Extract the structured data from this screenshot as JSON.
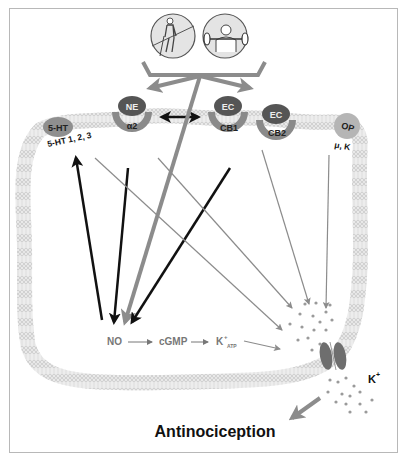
{
  "figure": {
    "exercise_icons": [
      {
        "name": "aerobic-exercise",
        "description": "person walking/running on incline"
      },
      {
        "name": "resistance-exercise",
        "description": "person lifting barbell"
      }
    ],
    "receptors": [
      {
        "ligand": "5-HT",
        "receptor": "5-HT 1, 2, 3"
      },
      {
        "ligand": "NE",
        "receptor": "α2"
      },
      {
        "ligand": "EC",
        "receptor": "CB1"
      },
      {
        "ligand": "EC",
        "receptor": "CB2"
      },
      {
        "ligand": "OP",
        "receptor": "μ, K"
      }
    ],
    "pathway": {
      "no": "NO",
      "cgmp": "cGMP",
      "katp_base": "K",
      "katp_sup": "+",
      "katp_sub": "ATP"
    },
    "channel_ion": {
      "base": "K",
      "sup": "+"
    },
    "outcome": "Antinociception",
    "colors": {
      "membrane": "#c8c8c8",
      "ligand_dark": "#5a5a5a",
      "ligand_light": "#9a9a9a",
      "receptor": "#8a8a8a",
      "arrow_black": "#111111",
      "arrow_gray": "#8c8c8c",
      "text": "#111111"
    }
  }
}
